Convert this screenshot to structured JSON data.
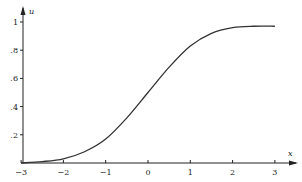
{
  "chart_data": {
    "type": "line",
    "title": "",
    "xlabel": "x",
    "ylabel": "u",
    "xlim": [
      -3,
      3.3
    ],
    "ylim": [
      0,
      1.05
    ],
    "grid": false,
    "legend": null,
    "x_ticks": [
      -3,
      -2,
      -1,
      0,
      1,
      2,
      3
    ],
    "x_tick_labels": [
      "−3",
      "−2",
      "−1",
      "0",
      "1",
      "2",
      "3"
    ],
    "y_ticks": [
      0.2,
      0.4,
      0.6,
      0.8,
      1.0
    ],
    "y_tick_labels": [
      ".2",
      ".4",
      ".6",
      ".8",
      "1"
    ],
    "series": [
      {
        "name": "u(x)",
        "x": [
          -3,
          -2.5,
          -2,
          -1.5,
          -1,
          -0.5,
          0,
          0.5,
          1,
          1.5,
          2,
          2.5,
          3
        ],
        "values": [
          0.0,
          0.01,
          0.03,
          0.08,
          0.17,
          0.32,
          0.5,
          0.68,
          0.83,
          0.92,
          0.96,
          0.97,
          0.97
        ]
      }
    ]
  }
}
